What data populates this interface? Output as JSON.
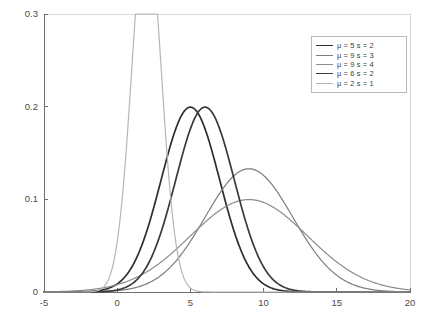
{
  "chart_data": {
    "type": "line",
    "title": "",
    "xlabel": "",
    "ylabel": "",
    "xlim": [
      -5,
      20
    ],
    "ylim": [
      0,
      0.3
    ],
    "grid": false,
    "legend_position": "top-right",
    "xticks": [
      "-5",
      "0",
      "5",
      "10",
      "15",
      "20"
    ],
    "xtick_values": [
      -5,
      0,
      5,
      10,
      15,
      20
    ],
    "yticks": [
      "0",
      "0.1",
      "0.2",
      "0.3"
    ],
    "ytick_values": [
      0,
      0.1,
      0.2,
      0.3
    ],
    "series": [
      {
        "name": "μ = 5 s = 2",
        "mu": 5,
        "sigma": 2,
        "color": "#2e2e2e",
        "width": 1.7,
        "peak_x": 5,
        "peak_y": 0.1995,
        "x": [
          -5,
          -4,
          -3,
          -2,
          -1,
          0,
          1,
          2,
          3,
          4,
          5,
          6,
          7,
          8,
          9,
          10,
          11,
          12,
          13,
          14,
          15,
          16,
          17,
          18,
          19,
          20
        ],
        "values": [
          0.0,
          0.0001,
          0.0002,
          0.0009,
          0.0022,
          0.0044,
          0.027,
          0.0648,
          0.121,
          0.176,
          0.1995,
          0.176,
          0.121,
          0.0648,
          0.027,
          0.0088,
          0.0022,
          0.0004,
          0.0001,
          0.0,
          0.0,
          0.0,
          0.0,
          0.0,
          0.0,
          0.0
        ]
      },
      {
        "name": "μ = 9 s = 3",
        "mu": 9,
        "sigma": 3,
        "color": "#7d7d7d",
        "width": 1.2,
        "peak_x": 9,
        "peak_y": 0.133,
        "x": [
          -5,
          -4,
          -3,
          -2,
          -1,
          0,
          1,
          2,
          3,
          4,
          5,
          6,
          7,
          8,
          9,
          10,
          11,
          12,
          13,
          14,
          15,
          16,
          17,
          18,
          19,
          20
        ],
        "values": [
          0.0,
          0.0001,
          0.0002,
          0.0005,
          0.0013,
          0.003,
          0.0063,
          0.012,
          0.0208,
          0.0328,
          0.0547,
          0.0807,
          0.1065,
          0.1258,
          0.133,
          0.1258,
          0.1065,
          0.0807,
          0.0547,
          0.0328,
          0.018,
          0.0088,
          0.0039,
          0.0015,
          0.0005,
          0.0002
        ]
      },
      {
        "name": "μ = 9 s = 4",
        "mu": 9,
        "sigma": 4,
        "color": "#8c8c8c",
        "width": 1.2,
        "peak_x": 9,
        "peak_y": 0.0997,
        "x": [
          -5,
          -4,
          -3,
          -2,
          -1,
          0,
          1,
          2,
          3,
          4,
          5,
          6,
          7,
          8,
          9,
          10,
          11,
          12,
          13,
          14,
          15,
          16,
          17,
          18,
          19,
          20
        ],
        "values": [
          0.0003,
          0.0006,
          0.0012,
          0.0022,
          0.0038,
          0.0062,
          0.0097,
          0.0143,
          0.02,
          0.0266,
          0.0334,
          0.0401,
          0.0457,
          0.0494,
          0.0997,
          0.0494,
          0.0457,
          0.0401,
          0.0334,
          0.0266,
          0.02,
          0.0143,
          0.0097,
          0.0062,
          0.0038,
          0.0022
        ]
      },
      {
        "name": "μ = 6 s = 2",
        "mu": 6,
        "sigma": 2,
        "color": "#3a3a3a",
        "width": 1.7,
        "peak_x": 6,
        "peak_y": 0.1995,
        "x": [
          -5,
          -4,
          -3,
          -2,
          -1,
          0,
          1,
          2,
          3,
          4,
          5,
          6,
          7,
          8,
          9,
          10,
          11,
          12,
          13,
          14,
          15,
          16,
          17,
          18,
          19,
          20
        ],
        "values": [
          0.0,
          0.0,
          0.0001,
          0.0002,
          0.0009,
          0.0022,
          0.0088,
          0.027,
          0.0648,
          0.121,
          0.176,
          0.1995,
          0.176,
          0.121,
          0.0648,
          0.027,
          0.0088,
          0.0022,
          0.0004,
          0.0001,
          0.0,
          0.0,
          0.0,
          0.0,
          0.0,
          0.0
        ]
      },
      {
        "name": "μ = 2 s = 1",
        "mu": 2,
        "sigma": 1,
        "color": "#b5b5b5",
        "width": 1.2,
        "peak_x": 2,
        "peak_y": 0.25,
        "x": [
          -5,
          -4,
          -3,
          -2,
          -1,
          0,
          1,
          2,
          3,
          4,
          5,
          6,
          7,
          8,
          9,
          10,
          11,
          12,
          13,
          14,
          15,
          16,
          17,
          18,
          19,
          20
        ],
        "values": [
          0.0,
          0.0,
          0.0,
          0.0001,
          0.0044,
          0.054,
          0.242,
          0.25,
          0.242,
          0.054,
          0.0044,
          0.0001,
          0.0,
          0.0,
          0.0,
          0.0,
          0.0,
          0.0,
          0.0,
          0.0,
          0.0,
          0.0,
          0.0,
          0.0,
          0.0,
          0.0
        ]
      }
    ],
    "legend_entries": [
      {
        "label": "μ = 5 s = 2",
        "color": "#2e2e2e",
        "width": 1.7
      },
      {
        "label": "μ = 9 s = 3",
        "color": "#7d7d7d",
        "width": 1.2
      },
      {
        "label": "μ = 9 s = 4",
        "color": "#8c8c8c",
        "width": 1.2
      },
      {
        "label": "μ = 6 s = 2",
        "color": "#3a3a3a",
        "width": 1.7
      },
      {
        "label": "μ = 2 s = 1",
        "color": "#b5b5b5",
        "width": 1.2
      }
    ],
    "axis_color": "#6e6e6e"
  }
}
